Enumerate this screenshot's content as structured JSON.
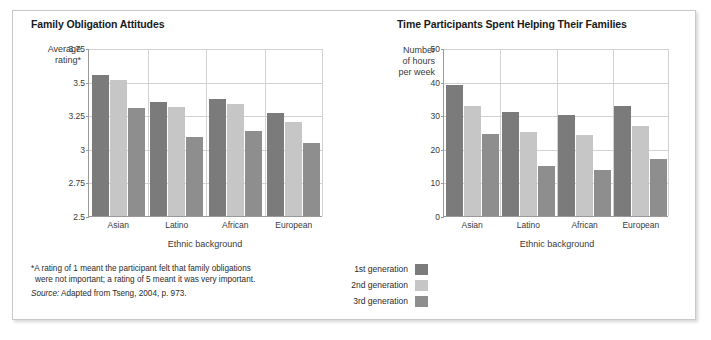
{
  "figure": {
    "footnote_line1": "*A rating of 1 meant the participant felt that family obligations",
    "footnote_line2": "were not important; a rating of 5 meant it was very important.",
    "source_prefix": "Source:",
    "source_text": "Adapted from Tseng, 2004, p. 973."
  },
  "legend": {
    "items": [
      {
        "label": "1st generation",
        "color": "#7b7b7b",
        "key": "1st"
      },
      {
        "label": "2nd generation",
        "color": "#c6c6c6",
        "key": "2nd"
      },
      {
        "label": "3rd generation",
        "color": "#8e8e8e",
        "key": "3rd"
      }
    ]
  },
  "chart_data": [
    {
      "type": "bar",
      "title": "Family Obligation Attitudes",
      "ylabel": "Average rating*",
      "ylabel_line1": "Average",
      "ylabel_line2": "rating*",
      "xlabel": "Ethnic background",
      "categories": [
        "Asian",
        "Latino",
        "African",
        "European"
      ],
      "yticks": [
        "3.75",
        "3.5",
        "3.25",
        "3",
        "2.75",
        "2.5"
      ],
      "ytick_values": [
        3.75,
        3.5,
        3.25,
        3,
        2.75,
        2.5
      ],
      "ylim": [
        2.5,
        3.75
      ],
      "grid": true,
      "legend_position": "below-between-panels",
      "series": [
        {
          "name": "1st generation",
          "color": "#7b7b7b",
          "values": [
            3.55,
            3.35,
            3.37,
            3.27
          ]
        },
        {
          "name": "2nd generation",
          "color": "#c6c6c6",
          "values": [
            3.51,
            3.31,
            3.33,
            3.2
          ]
        },
        {
          "name": "3rd generation",
          "color": "#8e8e8e",
          "values": [
            3.3,
            3.09,
            3.13,
            3.04
          ]
        }
      ]
    },
    {
      "type": "bar",
      "title": "Time Participants Spent Helping Their Families",
      "ylabel": "Number of hours per week",
      "ylabel_line1": "Number",
      "ylabel_line2": "of hours",
      "ylabel_line3": "per week",
      "xlabel": "Ethnic background",
      "categories": [
        "Asian",
        "Latino",
        "African",
        "European"
      ],
      "yticks": [
        "50",
        "40",
        "30",
        "20",
        "10",
        "0"
      ],
      "ytick_values": [
        50,
        40,
        30,
        20,
        10,
        0
      ],
      "ylim": [
        0,
        50
      ],
      "grid": true,
      "series": [
        {
          "name": "1st generation",
          "color": "#7b7b7b",
          "values": [
            39,
            31,
            30,
            32.8
          ]
        },
        {
          "name": "2nd generation",
          "color": "#c6c6c6",
          "values": [
            32.8,
            25,
            24,
            26.7
          ]
        },
        {
          "name": "3rd generation",
          "color": "#8e8e8e",
          "values": [
            24.3,
            15,
            13.8,
            17
          ]
        }
      ]
    }
  ]
}
